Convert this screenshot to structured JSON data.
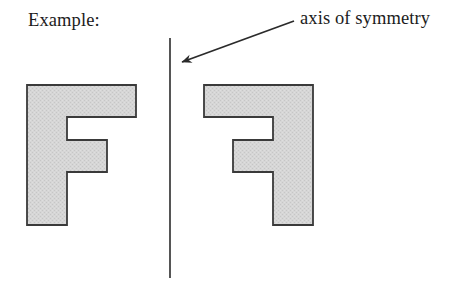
{
  "page": {
    "title": "Example: axis of symmetry",
    "background_color": "#ffffff"
  },
  "labels": {
    "example": "Example:",
    "axis_of_symmetry": "axis of symmetry"
  },
  "colors": {
    "shape_fill": "#d4d4d4",
    "shape_stroke": "#3a3a3a",
    "line": "#2b2b2b",
    "text": "#1c1c1c"
  },
  "figure": {
    "mirror_line": {
      "name": "axis-of-symmetry-line",
      "x": 170,
      "y_top": 38,
      "y_bottom": 278,
      "stroke_width": 1.6
    },
    "pointer": {
      "name": "axis-of-symmetry-arrow",
      "tail_x": 294,
      "tail_y": 21,
      "tip_x": 182,
      "tip_y": 62,
      "stroke_width": 1.8
    },
    "shapes": [
      {
        "name": "f-shape-original",
        "description": "Block letter F, original orientation",
        "points": "27,85 136,85 136,117 67,117 67,140 107,140 107,172 67,172 67,225 27,225"
      },
      {
        "name": "f-shape-mirrored",
        "description": "Block letter F mirrored across the vertical axis of symmetry",
        "points": "313,85 204,85 204,117 273,117 273,140 233,140 233,172 273,172 273,225 313,225"
      }
    ]
  }
}
